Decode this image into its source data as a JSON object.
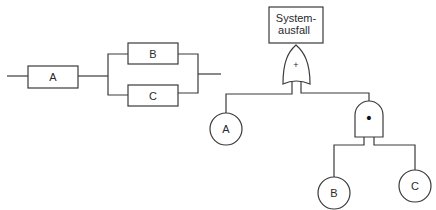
{
  "block_diagram": {
    "components": [
      {
        "id": "A",
        "label": "A"
      },
      {
        "id": "B",
        "label": "B"
      },
      {
        "id": "C",
        "label": "C"
      }
    ],
    "structure": "A in series with (B parallel C)"
  },
  "fault_tree": {
    "top_event": {
      "line1": "System-",
      "line2": "ausfall"
    },
    "or_gate": {
      "symbol": "+"
    },
    "and_gate": {
      "symbol": "•"
    },
    "basic_events": [
      {
        "id": "A",
        "label": "A"
      },
      {
        "id": "B",
        "label": "B"
      },
      {
        "id": "C",
        "label": "C"
      }
    ]
  }
}
